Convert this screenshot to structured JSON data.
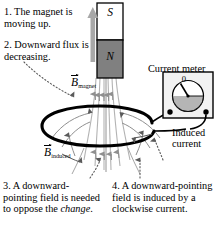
{
  "annotations": [
    {
      "id": "note-1",
      "text": "1. The magnet is moving up."
    },
    {
      "id": "note-2",
      "text": "2. Downward flux is decreasing."
    },
    {
      "id": "note-3",
      "text_before": "3. A downward-pointing field is needed to oppose the ",
      "emphasis": "change",
      "text_after": "."
    },
    {
      "id": "note-4",
      "text": "4. A downward-pointing field is induced by a clockwise current."
    }
  ],
  "magnet": {
    "south_pole_label": "S",
    "north_pole_label": "N",
    "south_fill": "#ffffff",
    "north_fill": "#808080",
    "outline": "#000000",
    "motion_arrow_color": "#9a9a9a",
    "motion_direction": "up"
  },
  "meter": {
    "label": "Current meter",
    "scale_zero_label": "0",
    "box_fill": "#f2f2f2",
    "dial_fill": "#ffffff",
    "sector_fill": "#b5b5b5",
    "needle_color": "#000000",
    "terminal_color": "#000000"
  },
  "loop": {
    "label_line_1": "Induced",
    "label_line_2": "current",
    "color": "#000000"
  },
  "fields": {
    "magnet_field_label": "B",
    "magnet_field_subscript": "magnet",
    "induced_field_label": "B",
    "induced_field_subscript": "induced",
    "field_line_color": "#b0b0b0",
    "induced_field_line_color": "#8f8f8f"
  },
  "colors": {
    "background": "#ffffff",
    "ink": "#000000",
    "gray": "#808080"
  }
}
